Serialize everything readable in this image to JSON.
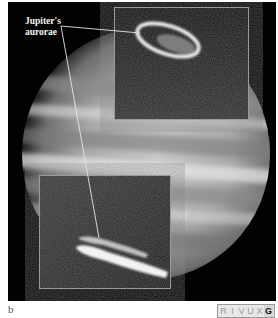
{
  "figure": {
    "label_line1": "Jupiter's",
    "label_line2": "aurorae",
    "panel_letter": "b",
    "insets": [
      {
        "name": "north-aurora-inset",
        "content": "ring-shaped aurora near north pole"
      },
      {
        "name": "south-aurora-inset",
        "content": "elongated arc aurora near south pole"
      }
    ]
  },
  "wavelength_bands": {
    "items": [
      {
        "label": "R",
        "active": false
      },
      {
        "label": "I",
        "active": false
      },
      {
        "label": "V",
        "active": false
      },
      {
        "label": "U",
        "active": false
      },
      {
        "label": "X",
        "active": false
      },
      {
        "label": "G",
        "active": true
      }
    ]
  },
  "colors": {
    "background": "#020202",
    "inset_border": "#9a9a9a",
    "callout_line": "#e6e6e6"
  }
}
